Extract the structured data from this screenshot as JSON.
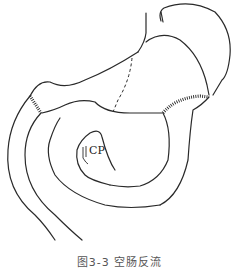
{
  "figure": {
    "caption": "图3-3  空肠反流",
    "labels": {
      "cp": "CP"
    },
    "line_color": "#2a2a2a",
    "background": "#ffffff"
  }
}
